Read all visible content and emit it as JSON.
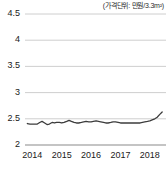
{
  "chart_data": {
    "type": "line",
    "title": "",
    "subtitle": "",
    "annotation": "(가격단위: 만원/3.3m²)",
    "xlabel": "",
    "ylabel": "",
    "xlim": [
      2013.75,
      2018.55
    ],
    "ylim": [
      2,
      4.5
    ],
    "yticks": [
      "2",
      "2.5",
      "3",
      "3.5",
      "4",
      "4.5"
    ],
    "ytick_values": [
      2,
      2.5,
      3,
      3.5,
      4,
      4.5
    ],
    "xticks": [
      "2014",
      "2015",
      "2016",
      "2017",
      "2018"
    ],
    "xtick_values": [
      2014,
      2015,
      2016,
      2017,
      2018
    ],
    "grid": true,
    "grid_axis": "y",
    "legend": "none",
    "line_color": "#3c3c3c",
    "grid_color": "#c8c8c8",
    "series": [
      {
        "name": "price",
        "x": [
          2013.83,
          2013.92,
          2014.0,
          2014.08,
          2014.17,
          2014.25,
          2014.33,
          2014.42,
          2014.5,
          2014.58,
          2014.67,
          2014.75,
          2014.83,
          2014.92,
          2015.0,
          2015.08,
          2015.17,
          2015.25,
          2015.33,
          2015.42,
          2015.5,
          2015.58,
          2015.67,
          2015.75,
          2015.83,
          2015.92,
          2016.0,
          2016.08,
          2016.17,
          2016.25,
          2016.33,
          2016.42,
          2016.5,
          2016.58,
          2016.67,
          2016.75,
          2016.83,
          2016.92,
          2017.0,
          2017.08,
          2017.17,
          2017.25,
          2017.33,
          2017.42,
          2017.5,
          2017.58,
          2017.67,
          2017.75,
          2017.83,
          2017.92,
          2018.0,
          2018.08,
          2018.17,
          2018.25,
          2018.33,
          2018.42
        ],
        "values": [
          2.41,
          2.4,
          2.4,
          2.4,
          2.4,
          2.43,
          2.45,
          2.42,
          2.39,
          2.4,
          2.43,
          2.42,
          2.43,
          2.43,
          2.42,
          2.43,
          2.45,
          2.47,
          2.45,
          2.43,
          2.42,
          2.42,
          2.43,
          2.44,
          2.45,
          2.44,
          2.44,
          2.45,
          2.46,
          2.45,
          2.44,
          2.43,
          2.42,
          2.42,
          2.43,
          2.44,
          2.44,
          2.43,
          2.42,
          2.42,
          2.42,
          2.42,
          2.42,
          2.42,
          2.42,
          2.42,
          2.42,
          2.43,
          2.44,
          2.45,
          2.46,
          2.48,
          2.5,
          2.53,
          2.58,
          2.63
        ]
      }
    ]
  }
}
